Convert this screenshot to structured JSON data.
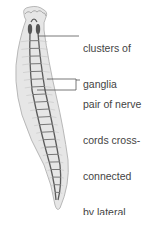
{
  "diagram": {
    "labels": [
      {
        "id": "ganglia",
        "lines": [
          "clusters of",
          "ganglia"
        ]
      },
      {
        "id": "nerve-cords",
        "lines": [
          "pair of nerve",
          "cords cross-",
          "connected",
          "by lateral",
          "nerves"
        ]
      }
    ],
    "colors": {
      "body_fill": "#e6e6e6",
      "body_outline": "#b8b8b8",
      "nerve": "#5a5a5a",
      "leader_line": "#555555",
      "label_text": "#444444"
    }
  }
}
